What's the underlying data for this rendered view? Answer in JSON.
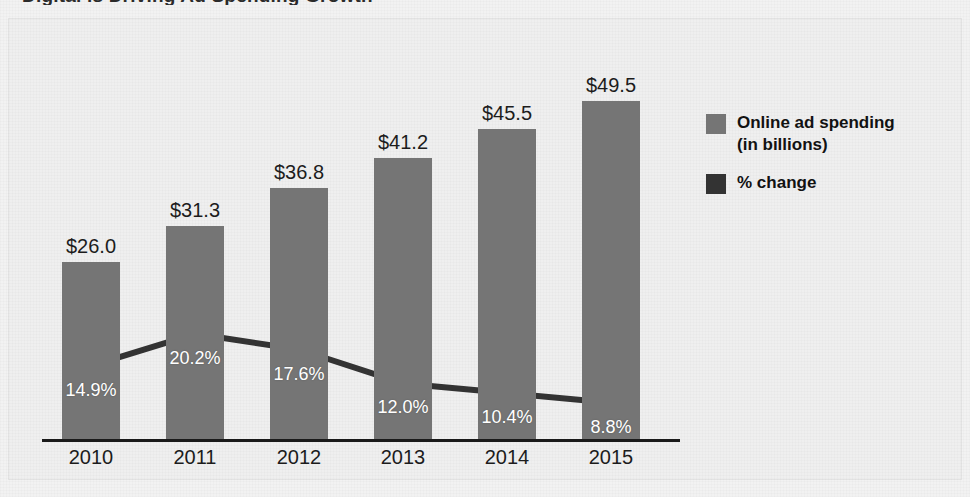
{
  "figure": {
    "title_cut_off": "Digital is Driving Ad Spending Growth",
    "background_color": "#efefef"
  },
  "legend": {
    "position": "right",
    "entries": [
      {
        "label": "Online ad spending\n(in billions)",
        "line1": "Online ad spending",
        "line2": "(in billions)",
        "color": "#757575",
        "swatch_name": "bars-swatch"
      },
      {
        "label": "% change",
        "line1": "% change",
        "line2": "",
        "color": "#333333",
        "swatch_name": "line-swatch"
      }
    ]
  },
  "chart_data": {
    "type": "bar",
    "title": "Digital is Driving Ad Spending Growth",
    "xlabel": "",
    "ylabel": "",
    "categories": [
      "2010",
      "2011",
      "2012",
      "2013",
      "2014",
      "2015"
    ],
    "grid": false,
    "legend_position": "right",
    "ylim": [
      0,
      55
    ],
    "series": [
      {
        "name": "Online ad spending (in billions)",
        "type": "bar",
        "color": "#757575",
        "values": [
          26.0,
          31.3,
          36.8,
          41.2,
          45.5,
          49.5
        ],
        "data_labels": [
          "$26.0",
          "$31.3",
          "$36.8",
          "$41.2",
          "$45.5",
          "$49.5"
        ]
      },
      {
        "name": "% change",
        "type": "line",
        "color": "#333333",
        "values": [
          14.9,
          20.2,
          17.6,
          12.0,
          10.4,
          8.8
        ],
        "data_labels": [
          "14.9%",
          "20.2%",
          "17.6%",
          "12.0%",
          "10.4%",
          "8.8%"
        ]
      }
    ]
  },
  "colors": {
    "bar": "#757575",
    "line": "#333333",
    "axis": "#1a1a1a",
    "page": "#efefef",
    "label_dark": "#1c1c1c",
    "label_light": "#ffffff"
  }
}
